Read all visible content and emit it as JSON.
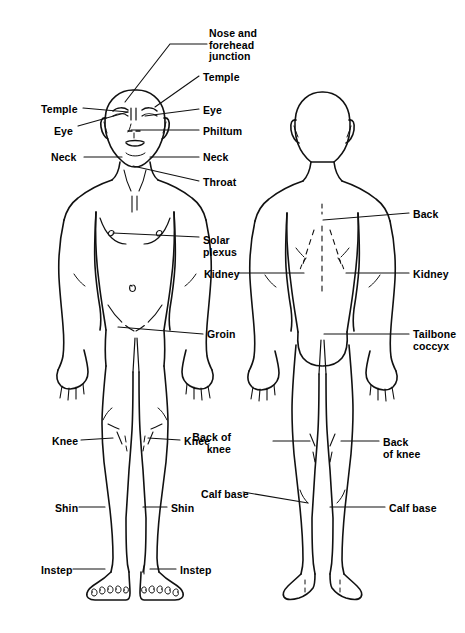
{
  "diagram": {
    "type": "anatomical-target-points",
    "background_color": "#ffffff",
    "stroke_color": "#000000",
    "width": 465,
    "height": 633,
    "figures": [
      {
        "id": "front-figure",
        "name": "Human body, front view (anterior)"
      },
      {
        "id": "back-figure",
        "name": "Human body, back view (posterior)"
      }
    ]
  },
  "labels": [
    {
      "id": "nose-forehead-junction",
      "text": "Nose and\nforehead\njunction",
      "x": 209,
      "y": 28,
      "align": "left",
      "figure": "front-figure"
    },
    {
      "id": "temple-right",
      "text": "Temple",
      "x": 203,
      "y": 72,
      "align": "left",
      "figure": "front-figure"
    },
    {
      "id": "temple-left",
      "text": "Temple",
      "x": 41,
      "y": 104,
      "align": "left",
      "figure": "front-figure"
    },
    {
      "id": "eye-right",
      "text": "Eye",
      "x": 203,
      "y": 105,
      "align": "left",
      "figure": "front-figure"
    },
    {
      "id": "eye-left",
      "text": "Eye",
      "x": 54,
      "y": 126,
      "align": "left",
      "figure": "front-figure"
    },
    {
      "id": "philtum",
      "text": "Philtum",
      "x": 203,
      "y": 126,
      "align": "left",
      "figure": "front-figure"
    },
    {
      "id": "neck-left",
      "text": "Neck",
      "x": 51,
      "y": 152,
      "align": "left",
      "figure": "front-figure"
    },
    {
      "id": "neck-right",
      "text": "Neck",
      "x": 203,
      "y": 152,
      "align": "left",
      "figure": "front-figure"
    },
    {
      "id": "throat",
      "text": "Throat",
      "x": 203,
      "y": 177,
      "align": "left",
      "figure": "front-figure"
    },
    {
      "id": "solar-plexus",
      "text": "Solar\nplexus",
      "x": 203,
      "y": 235,
      "align": "left",
      "figure": "front-figure"
    },
    {
      "id": "groin",
      "text": "Groin",
      "x": 207,
      "y": 329,
      "align": "left",
      "figure": "front-figure"
    },
    {
      "id": "knee-left",
      "text": "Knee",
      "x": 52,
      "y": 436,
      "align": "left",
      "figure": "front-figure"
    },
    {
      "id": "knee-right",
      "text": "Knee",
      "x": 184,
      "y": 436,
      "align": "left",
      "figure": "front-figure"
    },
    {
      "id": "shin-left",
      "text": "Shin",
      "x": 55,
      "y": 503,
      "align": "left",
      "figure": "front-figure"
    },
    {
      "id": "shin-right",
      "text": "Shin",
      "x": 171,
      "y": 503,
      "align": "left",
      "figure": "front-figure"
    },
    {
      "id": "instep-left",
      "text": "Instep",
      "x": 41,
      "y": 565,
      "align": "left",
      "figure": "front-figure"
    },
    {
      "id": "instep-right",
      "text": "Instep",
      "x": 180,
      "y": 565,
      "align": "left",
      "figure": "front-figure"
    },
    {
      "id": "back",
      "text": "Back",
      "x": 413,
      "y": 209,
      "align": "left",
      "figure": "back-figure"
    },
    {
      "id": "kidney-left",
      "text": "Kidney",
      "x": 204,
      "y": 269,
      "align": "left",
      "figure": "back-figure"
    },
    {
      "id": "kidney-right",
      "text": "Kidney",
      "x": 413,
      "y": 269,
      "align": "left",
      "figure": "back-figure"
    },
    {
      "id": "tailbone-coccyx",
      "text": "Tailbone\ncoccyx",
      "x": 413,
      "y": 329,
      "align": "left",
      "figure": "back-figure"
    },
    {
      "id": "back-of-knee-left",
      "text": "Back of\nknee",
      "x": 231,
      "y": 432,
      "align": "right",
      "figure": "back-figure"
    },
    {
      "id": "back-of-knee-right",
      "text": "Back\nof knee",
      "x": 383,
      "y": 437,
      "align": "left",
      "figure": "back-figure"
    },
    {
      "id": "calf-base-left",
      "text": "Calf base",
      "x": 201,
      "y": 489,
      "align": "left",
      "figure": "back-figure"
    },
    {
      "id": "calf-base-right",
      "text": "Calf base",
      "x": 389,
      "y": 503,
      "align": "left",
      "figure": "back-figure"
    }
  ],
  "leader_lines": [
    {
      "id": "leader-nose-forehead-junction",
      "points": "207,44 170,44 125,102"
    },
    {
      "id": "leader-temple-right",
      "points": "199,76 155,107"
    },
    {
      "id": "leader-temple-left",
      "points": "83,108 128,112"
    },
    {
      "id": "leader-eye-right",
      "points": "199,109 145,116"
    },
    {
      "id": "leader-eye-left",
      "points": "78,126 128,112"
    },
    {
      "id": "leader-philtum",
      "points": "199,130 131,130"
    },
    {
      "id": "leader-neck-left",
      "points": "84,157 122,157"
    },
    {
      "id": "leader-neck-right",
      "points": "199,157 150,157"
    },
    {
      "id": "leader-throat",
      "points": "199,181 133,166"
    },
    {
      "id": "leader-solar-plexus",
      "points": "199,237 113,233"
    },
    {
      "id": "leader-groin",
      "points": "203,334 118,327"
    },
    {
      "id": "leader-knee-left",
      "points": "81,440 113,438"
    },
    {
      "id": "leader-knee-right",
      "points": "180,440 148,438"
    },
    {
      "id": "leader-shin-left",
      "points": "79,507 105,507"
    },
    {
      "id": "leader-shin-right",
      "points": "167,507 143,507"
    },
    {
      "id": "leader-instep-left",
      "points": "73,569 105,569"
    },
    {
      "id": "leader-instep-right",
      "points": "176,569 150,569"
    },
    {
      "id": "leader-back",
      "points": "409,213 323,220"
    },
    {
      "id": "leader-kidney-left",
      "points": "238,273 304,273"
    },
    {
      "id": "leader-kidney-right",
      "points": "409,273 346,273"
    },
    {
      "id": "leader-tailbone-coccyx",
      "points": "409,334 324,334"
    },
    {
      "id": "leader-back-of-knee-left",
      "points": "273,441 310,441"
    },
    {
      "id": "leader-back-of-knee-right",
      "points": "379,441 341,441"
    },
    {
      "id": "leader-calf-base-left",
      "points": "243,492 308,503"
    },
    {
      "id": "leader-calf-base-right",
      "points": "385,507 330,507"
    }
  ]
}
